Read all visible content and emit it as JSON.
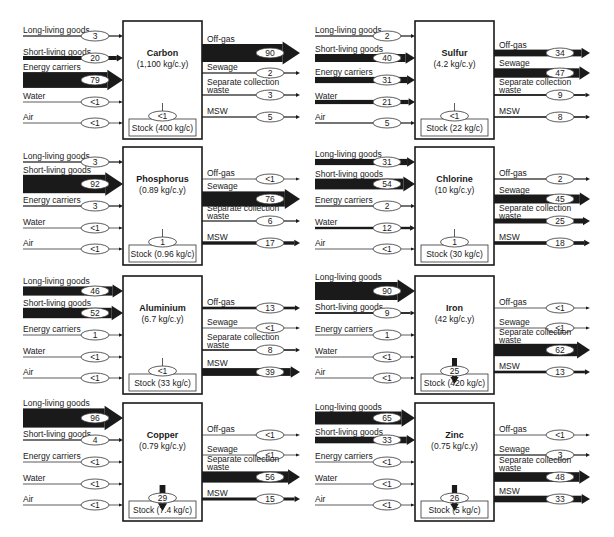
{
  "figure": {
    "input_labels": [
      "Long-living goods",
      "Short-living goods",
      "Energy carriers",
      "Water",
      "Air"
    ],
    "output_labels": [
      "Off-gas",
      "Sewage",
      "Separate collection waste",
      "MSW"
    ],
    "panels": [
      {
        "element": "Carbon",
        "throughput": "(1,100 kg/c.y)",
        "inputs": [
          "3",
          "20",
          "79",
          "<1",
          "<1"
        ],
        "outputs": [
          "90",
          "2",
          "3",
          "5"
        ],
        "stock_flow": "<1",
        "stock": "Stock (400 kg/c)"
      },
      {
        "element": "Sulfur",
        "throughput": "(4.2 kg/c.y)",
        "inputs": [
          "2",
          "40",
          "31",
          "21",
          "5"
        ],
        "outputs": [
          "34",
          "47",
          "9",
          "8"
        ],
        "stock_flow": "<1",
        "stock": "Stock (22 kg/c)"
      },
      {
        "element": "Phosphorus",
        "throughput": "(0.89 kg/c.y)",
        "inputs": [
          "3",
          "92",
          "3",
          "<1",
          "<1"
        ],
        "outputs": [
          "<1",
          "76",
          "6",
          "17"
        ],
        "stock_flow": "1",
        "stock": "Stock (0.96 kg/c)"
      },
      {
        "element": "Chlorine",
        "throughput": "(10 kg/c.y)",
        "inputs": [
          "31",
          "54",
          "2",
          "12",
          "<1"
        ],
        "outputs": [
          "2",
          "45",
          "25",
          "18"
        ],
        "stock_flow": "1",
        "stock": "Stock (30 kg/c)"
      },
      {
        "element": "Aluminium",
        "throughput": "(6.7 kg/c.y)",
        "inputs": [
          "46",
          "52",
          "1",
          "<1",
          "<1"
        ],
        "outputs": [
          "13",
          "<1",
          "8",
          "39"
        ],
        "stock_flow": "<1",
        "stock": "Stock (33 kg/c)"
      },
      {
        "element": "Iron",
        "throughput": "(42 kg/c.y)",
        "inputs": [
          "90",
          "9",
          "1",
          "<1",
          "<1"
        ],
        "outputs": [
          "<1",
          "<1",
          "62",
          "13"
        ],
        "stock_flow": "25",
        "stock": "Stock (420 kg/c)"
      },
      {
        "element": "Copper",
        "throughput": "(0.79 kg/c.y)",
        "inputs": [
          "96",
          "4",
          "<1",
          "<1",
          "<1"
        ],
        "outputs": [
          "<1",
          "<1",
          "56",
          "15"
        ],
        "stock_flow": "29",
        "stock": "Stock (7.4 kg/c)"
      },
      {
        "element": "Zinc",
        "throughput": "(0.75 kg/c.y)",
        "inputs": [
          "65",
          "33",
          "<1",
          "<1",
          "<1"
        ],
        "outputs": [
          "<1",
          "3",
          "48",
          "33"
        ],
        "stock_flow": "26",
        "stock": "Stock (5 kg/c)"
      }
    ],
    "colors": {
      "ink": "#1a1a1a",
      "line": "#333333",
      "background": "#ffffff"
    }
  }
}
